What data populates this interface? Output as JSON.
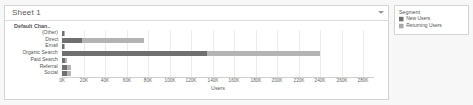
{
  "sheet": {
    "title": "Sheet 1",
    "caret_icon": "chevron-down-icon"
  },
  "legend": {
    "title": "Segment",
    "items": [
      {
        "label": "New Users",
        "color": "#707070"
      },
      {
        "label": "Returning Users",
        "color": "#a8a8a8"
      }
    ]
  },
  "chart_data": {
    "type": "bar",
    "orientation": "horizontal",
    "stacked": true,
    "title": "",
    "field_caption": "Default Chan..",
    "xlabel": "Users",
    "ylabel": "",
    "xlim": [
      0,
      290000
    ],
    "grid": true,
    "legend_position": "right",
    "tick_labels": [
      "0K",
      "20K",
      "40K",
      "60K",
      "80K",
      "100K",
      "120K",
      "140K",
      "160K",
      "180K",
      "200K",
      "220K",
      "240K",
      "260K",
      "280K"
    ],
    "tick_values": [
      0,
      20000,
      40000,
      60000,
      80000,
      100000,
      120000,
      140000,
      160000,
      180000,
      200000,
      220000,
      240000,
      260000,
      280000
    ],
    "categories": [
      "(Other)",
      "Direct",
      "Email",
      "Organic Search",
      "Paid Search",
      "Referral",
      "Social"
    ],
    "series": [
      {
        "name": "New Users",
        "color": "#707070",
        "values": [
          2000,
          19000,
          2000,
          135000,
          3000,
          5000,
          5000
        ]
      },
      {
        "name": "Returning Users",
        "color": "#b4b4b4",
        "values": [
          1000,
          57000,
          1000,
          105000,
          2000,
          3000,
          3000
        ]
      }
    ],
    "totals": [
      3000,
      76000,
      3000,
      240000,
      5000,
      8000,
      8000
    ]
  }
}
